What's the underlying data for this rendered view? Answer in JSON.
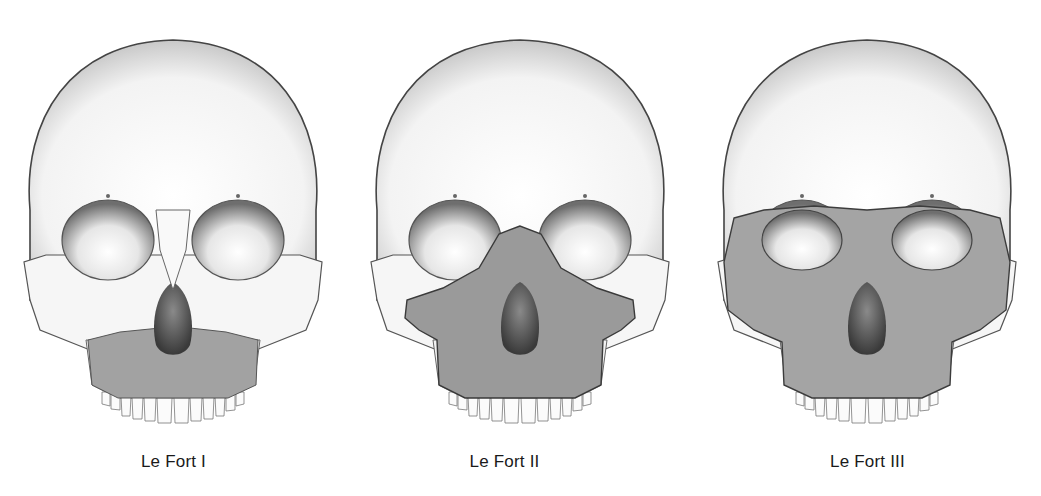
{
  "figure": {
    "background": "#ffffff",
    "bone_color": "#f7f7f7",
    "bone_outline": "#3c3c3c",
    "fracture_fill": "#9e9e9e",
    "panels": [
      {
        "caption": "Le Fort I",
        "fracture_type": "horizontal maxillary (floating palate)",
        "center_x": 173,
        "caption_x": 173
      },
      {
        "caption": "Le Fort II",
        "fracture_type": "pyramidal (nasomaxillary)",
        "center_x": 520,
        "caption_x": 504
      },
      {
        "caption": "Le Fort III",
        "fracture_type": "craniofacial disjunction",
        "center_x": 867,
        "caption_x": 868
      }
    ]
  }
}
